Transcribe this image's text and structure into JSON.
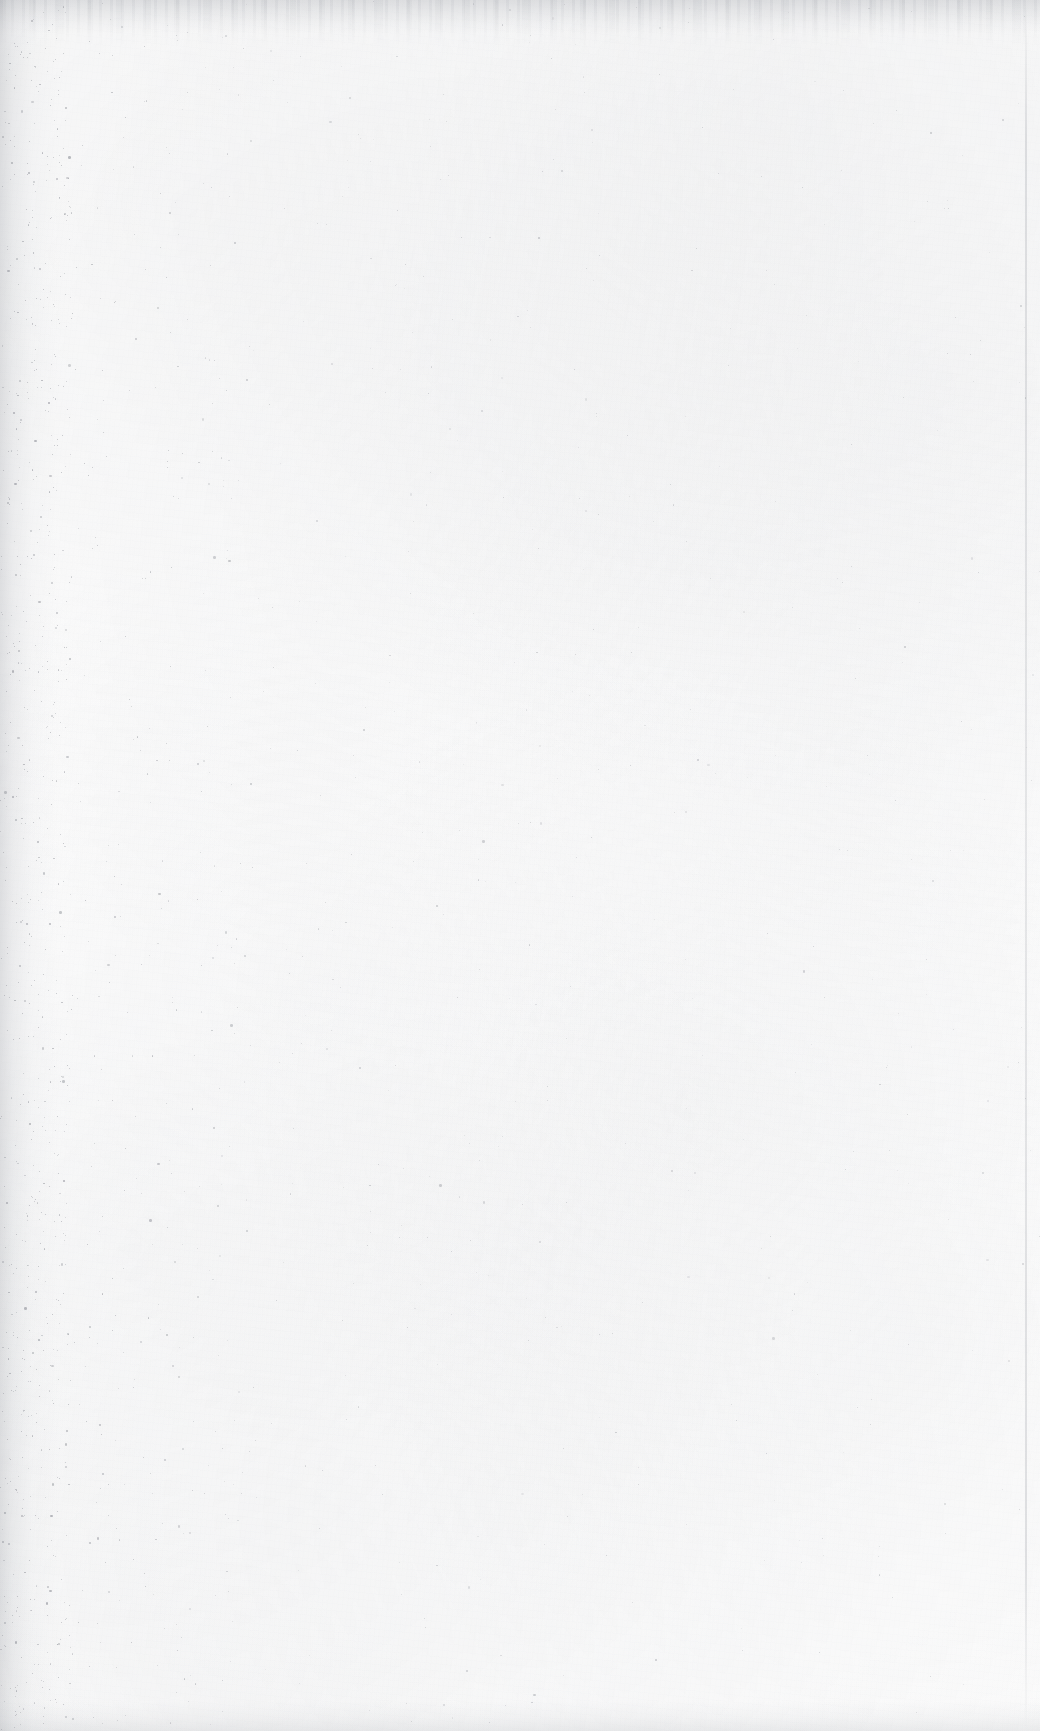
{
  "document": {
    "kind": "scanned-page",
    "page_label": "",
    "visible_text": "",
    "content_summary": "blank page",
    "width_px": 1040,
    "height_px": 1731
  },
  "appearance": {
    "paper_color": "#fcfcfc",
    "page_background": "#ffffff",
    "speckle_color": "#8f9299",
    "edge_shadow_color": "#a3a6ac",
    "gutter_edge": "left",
    "scan_edge_line_color": "#a0a3aa"
  },
  "artifacts": {
    "top_edge_shadow": "scan border shadow band",
    "left_gutter": "dense scanner dust along binding edge",
    "right_edge_line": "faint vertical scan boundary line",
    "grain": "low-frequency paper mottling"
  }
}
